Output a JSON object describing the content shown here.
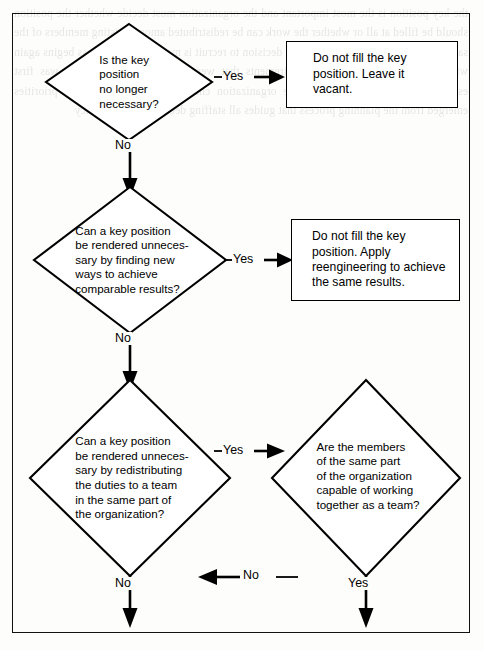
{
  "diagram": {
    "colors": {
      "ink": "#000000",
      "page": "#fdfdfb",
      "border": "#111111"
    },
    "bleed_text": "the key position is the most important and the organization must decide whether the position should be filled at all or whether the work can be redistributed among existing members of the same unit of the organization before a decision to recruit is made and the process begins again with a review of the original requirements that were used when the position was first established and later revised as the organization changed over time and new priorities emerged from the planning process that guides all staffing decisions in the agency",
    "nodes": [
      {
        "id": "d1",
        "type": "decision",
        "text": "Is the key\nposition\nno longer\nnecessary?"
      },
      {
        "id": "p1",
        "type": "process",
        "text": "Do not fill the key\nposition. Leave it\nvacant."
      },
      {
        "id": "d2",
        "type": "decision",
        "text": "Can a key position\nbe rendered unneces-\nsary by finding new\nways to achieve\ncomparable results?"
      },
      {
        "id": "p2",
        "type": "process",
        "text": "Do not fill the key\nposition. Apply\nreengineering to achieve\nthe same results."
      },
      {
        "id": "d3",
        "type": "decision",
        "text": "Can a key position\nbe rendered unneces-\nsary by redistributing\nthe duties to a team\nin the same part of\nthe organization?"
      },
      {
        "id": "d4",
        "type": "decision",
        "text": "Are the members\nof the same part\nof the organization\ncapable of working\ntogether as a team?"
      }
    ],
    "connectors": [
      {
        "id": "c1",
        "label": "Yes",
        "from": "d1",
        "to": "p1",
        "direction": "right"
      },
      {
        "id": "c2",
        "label": "No",
        "from": "d1",
        "to": "d2",
        "direction": "down"
      },
      {
        "id": "c3",
        "label": "Yes",
        "from": "d2",
        "to": "p2",
        "direction": "right"
      },
      {
        "id": "c4",
        "label": "No",
        "from": "d2",
        "to": "d3",
        "direction": "down"
      },
      {
        "id": "c5",
        "label": "Yes",
        "from": "d3",
        "to": "d4",
        "direction": "right"
      },
      {
        "id": "c6",
        "label": "No",
        "from": "d4",
        "to": "d3",
        "direction": "left"
      },
      {
        "id": "c7",
        "label": "No",
        "from": "d3",
        "to": "exit-left",
        "direction": "down"
      },
      {
        "id": "c8",
        "label": "Yes",
        "from": "d4",
        "to": "exit-right",
        "direction": "down"
      }
    ]
  }
}
